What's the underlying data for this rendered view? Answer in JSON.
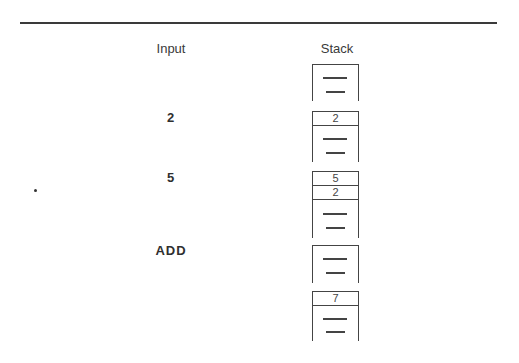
{
  "headers": {
    "input": "Input",
    "stack": "Stack"
  },
  "steps": [
    {
      "input": "",
      "stack": []
    },
    {
      "input": "2",
      "stack": [
        "2"
      ]
    },
    {
      "input": "5",
      "stack": [
        "5",
        "2"
      ]
    },
    {
      "input": "ADD",
      "stack": []
    },
    {
      "input": "",
      "stack": [
        "7"
      ]
    }
  ],
  "colors": {
    "ink": "#444444",
    "background": "#ffffff"
  }
}
